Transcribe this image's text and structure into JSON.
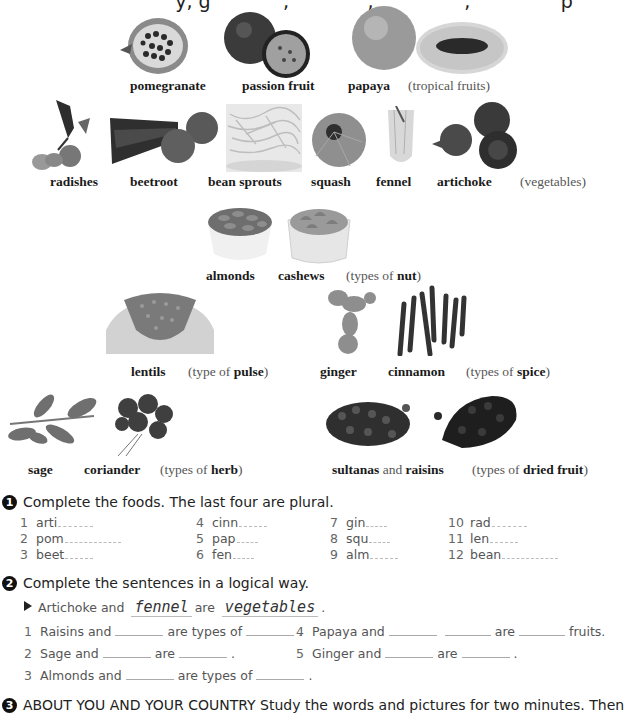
{
  "top_cut_text": "...y, ginger and ..., ..., ..., ...p...",
  "groups": {
    "tropical_fruits": {
      "items": [
        "pomegranate",
        "passion fruit",
        "papaya"
      ],
      "category_prefix": "",
      "category_bold": "",
      "category_text": "(tropical fruits)"
    },
    "vegetables": {
      "items": [
        "radishes",
        "beetroot",
        "bean sprouts",
        "squash",
        "fennel",
        "artichoke"
      ],
      "category_text": "(vegetables)"
    },
    "nuts": {
      "items": [
        "almonds",
        "cashews"
      ],
      "category_prefix": "(types of ",
      "category_bold": "nut",
      "category_suffix": ")"
    },
    "pulse": {
      "items": [
        "lentils"
      ],
      "category_prefix": "(type of ",
      "category_bold": "pulse",
      "category_suffix": ")"
    },
    "spices": {
      "items": [
        "ginger",
        "cinnamon"
      ],
      "category_prefix": "(types of ",
      "category_bold": "spice",
      "category_suffix": ")"
    },
    "herbs": {
      "items": [
        "sage",
        "coriander"
      ],
      "category_prefix": "(types of ",
      "category_bold": "herb",
      "category_suffix": ")"
    },
    "dried_fruit": {
      "item1": "sultanas",
      "joiner": "and",
      "item2": "raisins",
      "category_prefix": "(types of ",
      "category_bold": "dried fruit",
      "category_suffix": ")"
    }
  },
  "exercise1": {
    "number": "1",
    "instruction": "Complete the foods. The last four are plural.",
    "items": [
      {
        "n": "1",
        "stem": "arti",
        "blanks": 5
      },
      {
        "n": "2",
        "stem": "pom",
        "blanks": 8
      },
      {
        "n": "3",
        "stem": "beet",
        "blanks": 4
      },
      {
        "n": "4",
        "stem": "cinn",
        "blanks": 4
      },
      {
        "n": "5",
        "stem": "pap",
        "blanks": 3
      },
      {
        "n": "6",
        "stem": "fen",
        "blanks": 3
      },
      {
        "n": "7",
        "stem": "gin",
        "blanks": 3
      },
      {
        "n": "8",
        "stem": "squ",
        "blanks": 3
      },
      {
        "n": "9",
        "stem": "alm",
        "blanks": 4
      },
      {
        "n": "10",
        "stem": "rad",
        "blanks": 5
      },
      {
        "n": "11",
        "stem": "len",
        "blanks": 4
      },
      {
        "n": "12",
        "stem": "bean",
        "blanks": 8
      }
    ]
  },
  "exercise2": {
    "number": "2",
    "instruction": "Complete the sentences in a logical way.",
    "example": {
      "part1": "Artichoke and",
      "answer1": "fennel",
      "part2": "are",
      "answer2": "vegetables",
      "end": "."
    },
    "sentences": [
      {
        "n": "1",
        "a": "Raisins and",
        "b": "are types of",
        "c": "."
      },
      {
        "n": "2",
        "a": "Sage and",
        "b": "are",
        "c": "."
      },
      {
        "n": "3",
        "a": "Almonds and",
        "b": "are types of",
        "c": "."
      },
      {
        "n": "4",
        "a": "Papaya and",
        "b": "are",
        "c": "fruits."
      },
      {
        "n": "5",
        "a": "Ginger and",
        "b": "are",
        "c": "."
      }
    ]
  },
  "exercise3": {
    "number": "3",
    "instruction": "ABOUT YOU AND YOUR COUNTRY Study the words and pictures for two minutes. Then"
  }
}
